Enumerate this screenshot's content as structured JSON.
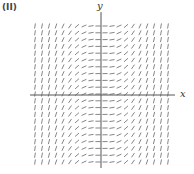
{
  "panel_label": "(II)",
  "axes": {
    "x_label": "x",
    "y_label": "y"
  },
  "field": {
    "description": "slope field, slope depends on x only (approx y' = x^2)",
    "cols": 20,
    "rows": 21,
    "x_range": [
      -2,
      2
    ],
    "y_range": [
      -2,
      2
    ],
    "color": "#666666"
  }
}
